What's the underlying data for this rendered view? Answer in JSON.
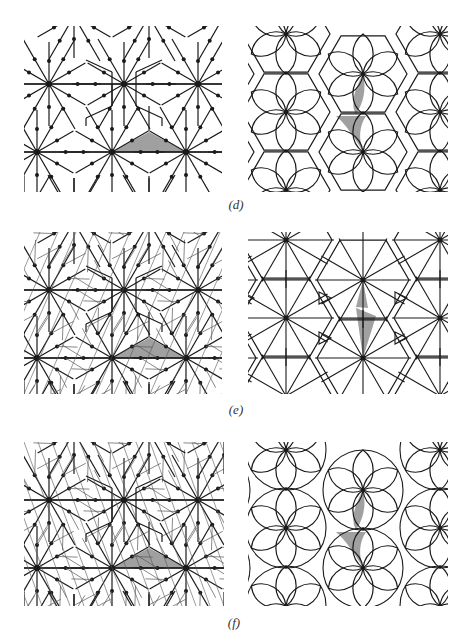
{
  "figure": {
    "rows": [
      {
        "label": "(d)",
        "left": {
          "type": "edge-graph",
          "description": "hexagonal symmetry graph with dotted vertices, shaded triangular fundamental region"
        },
        "right": {
          "type": "tiling",
          "description": "hexagons with six-petal lens rosettes, shaded lens and curved triangle"
        }
      },
      {
        "label": "(e)",
        "left": {
          "type": "edge-graph",
          "description": "denser graph with additional thin diagonals, shaded triangle"
        },
        "right": {
          "type": "tiling",
          "description": "triangulated star tiling with 12-fold vertices, shaded kite pieces"
        }
      },
      {
        "label": "(f)",
        "left": {
          "type": "edge-graph",
          "description": "graph with parallel thin hatching lines, shaded triangle"
        },
        "right": {
          "type": "tiling",
          "description": "overlapping circle-petal rosettes with small triangles, shaded lens and curved triangle"
        }
      }
    ],
    "colors": {
      "line": "#1a1a1a",
      "shade": "#a0a0a0",
      "background": "#ffffff",
      "thin_line": "#555555"
    }
  }
}
